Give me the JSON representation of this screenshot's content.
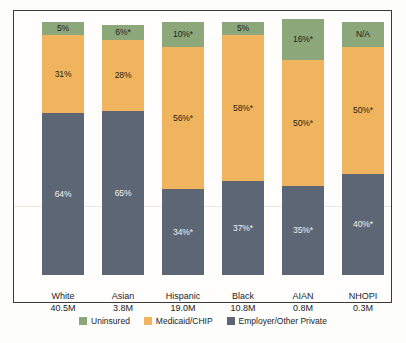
{
  "chart_data": {
    "type": "bar",
    "subtype": "stacked-bar-100",
    "title": "",
    "subtitle": "",
    "xlabel": "",
    "ylabel": "",
    "ylim": [
      0,
      100
    ],
    "grid": false,
    "legend_position": "bottom",
    "categories": [
      "White",
      "Asian",
      "Hispanic",
      "Black",
      "AIAN",
      "NHOPI"
    ],
    "category_sublabels": [
      "40.5M",
      "3.8M",
      "19.0M",
      "10.8M",
      "0.8M",
      "0.3M"
    ],
    "series": [
      {
        "name": "Uninsured",
        "color": "#8ca87a",
        "values": [
          5,
          6,
          10,
          5,
          16,
          null
        ],
        "labels": [
          "5%",
          "6%*",
          "10%*",
          "5%",
          "16%*",
          "N/A"
        ]
      },
      {
        "name": "Medicaid/CHIP",
        "color": "#efb45d",
        "values": [
          31,
          28,
          56,
          58,
          50,
          50
        ],
        "labels": [
          "31%",
          "28%",
          "56%*",
          "58%*",
          "50%*",
          "50%*"
        ]
      },
      {
        "name": "Employer/Other Private",
        "color": "#5d6674",
        "values": [
          64,
          65,
          34,
          37,
          35,
          40
        ],
        "labels": [
          "64%",
          "65%",
          "34%*",
          "37%*",
          "35%*",
          "40%*"
        ]
      }
    ]
  },
  "legend": {
    "items": [
      {
        "label": "Uninsured",
        "color": "#8ca87a",
        "swatch_name": "legend-swatch-uninsured"
      },
      {
        "label": "Medicaid/CHIP",
        "color": "#efb45d",
        "swatch_name": "legend-swatch-medicaid"
      },
      {
        "label": "Employer/Other Private",
        "color": "#5d6674",
        "swatch_name": "legend-swatch-employer"
      }
    ]
  },
  "colors": {
    "uninsured": "#8ca87a",
    "medicaid": "#efb45d",
    "employer": "#5d6674",
    "frame": "#3a3a3a",
    "background": "#fdfdfc",
    "text": "#23231f",
    "light_text": "#f2f2f0"
  }
}
